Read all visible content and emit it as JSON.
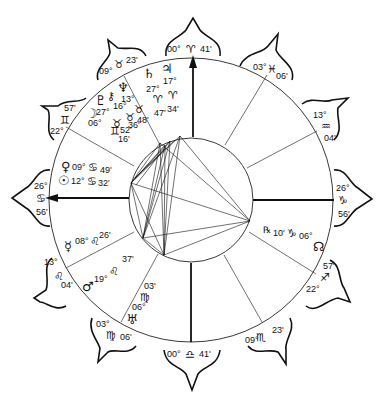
{
  "chart": {
    "type": "natal-chart-wheel",
    "center": [
      191,
      200
    ],
    "outer_radius": 142,
    "inner_radius": 63,
    "house_cusps": [
      {
        "id": "mc",
        "glyph": "♈",
        "deg": "00°",
        "min": "41'",
        "sign": "Aries"
      },
      {
        "id": "c11",
        "glyph": "♓",
        "deg": "03°",
        "min": "06'",
        "sign": "Pisces"
      },
      {
        "id": "c12",
        "glyph": "♒",
        "deg": "13°",
        "min": "04'",
        "sign": "Aquarius"
      },
      {
        "id": "dsc",
        "glyph": "♑",
        "deg": "26°",
        "min": "56'",
        "sign": "Capricorn"
      },
      {
        "id": "c5",
        "glyph": "♐",
        "deg": "22°",
        "min": "57'",
        "sign": "Sagittarius"
      },
      {
        "id": "c6",
        "glyph": "♏",
        "deg": "09°",
        "min": "23'",
        "sign": "Scorpio"
      },
      {
        "id": "ic",
        "glyph": "♎",
        "deg": "00°",
        "min": "41'",
        "sign": "Libra"
      },
      {
        "id": "c5b",
        "glyph": "♍",
        "deg": "03°",
        "min": "06'",
        "sign": "Virgo"
      },
      {
        "id": "c3",
        "glyph": "♌",
        "deg": "13°",
        "min": "04'",
        "sign": "Leo"
      },
      {
        "id": "asc",
        "glyph": "♋",
        "deg": "26°",
        "min": "56'",
        "sign": "Cancer"
      },
      {
        "id": "c11b",
        "glyph": "♊",
        "deg": "22°",
        "min": "57'",
        "sign": "Gemini"
      },
      {
        "id": "c10b",
        "glyph": "♉",
        "deg": "09°",
        "min": "23'",
        "sign": "Taurus"
      }
    ],
    "planets": [
      {
        "name": "Saturn",
        "glyph": "♄",
        "deg": "27°",
        "sign": "♈",
        "min": "47'"
      },
      {
        "name": "Jupiter",
        "glyph": "♃",
        "deg": "17°",
        "sign": "♈",
        "min": "34'"
      },
      {
        "name": "Neptune",
        "glyph": "♆",
        "deg": "13°",
        "sign": "♉",
        "min": "48'"
      },
      {
        "name": "Chiron",
        "glyph": "⚷",
        "deg": "16°",
        "sign": "♉",
        "min": "36'"
      },
      {
        "name": "Pluto",
        "glyph": "♇",
        "deg": "27°",
        "sign": "♉",
        "min": "52'"
      },
      {
        "name": "Moon",
        "glyph": "☽",
        "deg": "06°",
        "sign": "♊",
        "min": "16'"
      },
      {
        "name": "Venus",
        "glyph": "♀",
        "deg": "09°",
        "sign": "♋",
        "min": "49'"
      },
      {
        "name": "Sun",
        "glyph": "☉",
        "deg": "12°",
        "sign": "♋",
        "min": "32'"
      },
      {
        "name": "Mercury",
        "glyph": "☿",
        "deg": "08°",
        "sign": "♌",
        "min": "26'"
      },
      {
        "name": "Mars",
        "glyph": "♂",
        "deg": "19°",
        "sign": "♌",
        "min": "37'"
      },
      {
        "name": "Uranus",
        "glyph": "♅",
        "deg": "06°",
        "sign": "♍",
        "min": "03'"
      },
      {
        "name": "North Node",
        "glyph": "☊",
        "deg": "06°",
        "sign": "♑",
        "min": "10'",
        "retrograde": "℞"
      }
    ],
    "labels": {
      "mc_deg": "00°",
      "mc_sign": "♈",
      "mc_min": "41'",
      "ic_deg": "00°",
      "ic_sign": "♎",
      "ic_min": "41'",
      "pisces_deg": "03°",
      "pisces_sign": "♓",
      "pisces_min": "06'",
      "aquarius_deg": "13°",
      "aquarius_sign": "♒",
      "aquarius_min": "04'",
      "capricorn_deg": "26°",
      "capricorn_sign": "♑",
      "capricorn_min": "56'",
      "sagittarius_min": "57'",
      "sagittarius_sign": "♐",
      "sagittarius_deg": "22°",
      "scorpio_deg": "09°",
      "scorpio_sign": "♏",
      "scorpio_min": "23'",
      "virgo_deg": "03°",
      "virgo_sign": "♍",
      "virgo_min": "06'",
      "leo_deg": "13°",
      "leo_sign": "♌",
      "leo_min": "04'",
      "cancer_deg": "26°",
      "cancer_sign": "♋",
      "cancer_min": "56'",
      "gemini_min": "57'",
      "gemini_sign": "♊",
      "gemini_deg": "22°",
      "taurus_deg": "09°",
      "taurus_sign": "♉",
      "taurus_min": "23'",
      "saturn_glyph": "♄",
      "saturn_deg": "27°",
      "saturn_sign": "♈",
      "saturn_min": "47'",
      "jupiter_glyph": "♃",
      "jupiter_deg": "17°",
      "jupiter_sign": "♈",
      "jupiter_min": "34'",
      "neptune_glyph": "♆",
      "neptune_deg": "13°",
      "neptune_sign": "♉",
      "neptune_min": "48'",
      "chiron_glyph": "⚷",
      "chiron_deg": "16°",
      "chiron_sign": "♉",
      "chiron_min": "36'",
      "pluto_glyph": "♇",
      "pluto_deg": "27°",
      "pluto_sign": "♉",
      "pluto_min": "52'",
      "moon_glyph": "☽",
      "moon_deg": "06°",
      "moon_sign": "♊",
      "moon_min": "16'",
      "venus_glyph": "♀",
      "venus_deg": "09°",
      "venus_sign": "♋",
      "venus_min": "49'",
      "sun_glyph": "☉",
      "sun_deg": "12°",
      "sun_sign": "♋",
      "sun_min": "32'",
      "mercury_glyph": "☿",
      "mercury_deg": "08°",
      "mercury_sign": "♌",
      "mercury_min": "26'",
      "mars_glyph": "♂",
      "mars_deg": "19°",
      "mars_sign": "♌",
      "mars_min": "37'",
      "uranus_glyph": "♅",
      "uranus_deg": "06°",
      "uranus_sign": "♍",
      "uranus_min": "03'",
      "node_glyph": "☊",
      "node_retro": "℞",
      "node_min": "10'",
      "node_sign": "♑",
      "node_deg": "06°"
    }
  }
}
